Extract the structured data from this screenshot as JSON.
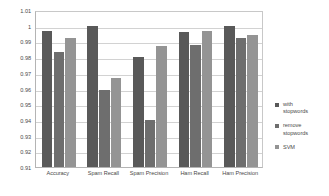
{
  "chart_data": {
    "type": "bar",
    "title": "",
    "subtitle": "",
    "xlabel": "",
    "ylabel": "",
    "ylim": [
      0.91,
      1.01
    ],
    "ytick_step": 0.01,
    "grid": true,
    "legend_position": "right",
    "categories": [
      "Accuracy",
      "Spam Recall",
      "Spam Precision",
      "Ham Recall",
      "Ham Precision"
    ],
    "ytick_labels": [
      "1.01",
      "1",
      "0.99",
      "0.98",
      "0.97",
      "0.96",
      "0.95",
      "0.94",
      "0.93",
      "0.92",
      "0.91"
    ],
    "ytick_values": [
      1.01,
      1.0,
      0.99,
      0.98,
      0.97,
      0.96,
      0.95,
      0.94,
      0.93,
      0.92,
      0.91
    ],
    "series": [
      {
        "name": "with stopwords",
        "color": "#595959",
        "values": [
          0.9968,
          0.9998,
          0.98,
          0.996,
          1.0
        ]
      },
      {
        "name": "remove stopwords",
        "color": "#6E6E6E",
        "values": [
          0.9832,
          0.959,
          0.94,
          0.988,
          0.992
        ]
      },
      {
        "name": "SVM",
        "color": "#949494",
        "values": [
          0.992,
          0.967,
          0.9872,
          0.9968,
          0.994
        ]
      }
    ]
  },
  "legend": {
    "items": [
      {
        "label_line1": "with",
        "label_line2": "stopwords"
      },
      {
        "label_line1": "remove",
        "label_line2": "stopwords"
      },
      {
        "label_line1": "SVM",
        "label_line2": ""
      }
    ]
  }
}
